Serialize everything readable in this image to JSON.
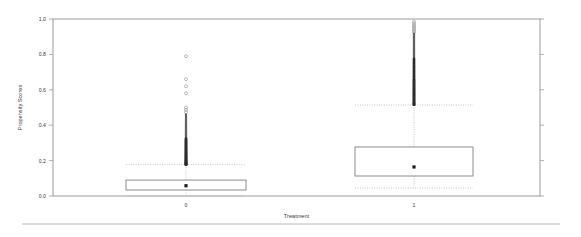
{
  "chart_data": {
    "type": "box",
    "title": "",
    "xlabel": "Treatment",
    "ylabel": "Propensity Scores",
    "categories": [
      "0",
      "1"
    ],
    "ylim": [
      0.0,
      1.0
    ],
    "ytick_labels": [
      "0.0",
      "0.2",
      "0.4",
      "0.6",
      "0.8",
      "1.0"
    ],
    "ytick_values": [
      0.0,
      0.2,
      0.4,
      0.6,
      0.8,
      1.0
    ],
    "xtick_labels": [
      "0",
      "1"
    ],
    "grid": false,
    "legend": "none",
    "right_axis_ticks_unlabeled": true,
    "boxes": [
      {
        "category": "0",
        "q1": 0.034,
        "median": 0.058,
        "q3": 0.09,
        "whisker_low": 0.0,
        "whisker_high": 0.177,
        "outlier_min": 0.18,
        "outlier_max": 0.79,
        "outlier_count_visible": 120,
        "outliers": [
          0.79,
          0.66,
          0.62,
          0.58,
          0.5,
          0.487,
          0.474,
          0.461,
          0.452,
          0.441,
          0.43,
          0.421,
          0.412,
          0.403,
          0.395,
          0.388,
          0.38,
          0.372,
          0.365,
          0.358,
          0.351,
          0.344,
          0.338,
          0.331,
          0.325,
          0.319,
          0.313,
          0.307,
          0.301,
          0.296,
          0.29,
          0.285,
          0.28,
          0.275,
          0.27,
          0.265,
          0.26,
          0.256,
          0.251,
          0.247,
          0.243,
          0.239,
          0.235,
          0.231,
          0.227,
          0.224,
          0.22,
          0.217,
          0.213,
          0.21,
          0.207,
          0.204,
          0.201,
          0.198,
          0.196,
          0.193,
          0.191,
          0.188,
          0.186,
          0.184,
          0.182,
          0.18,
          0.1795,
          0.179,
          0.1785,
          0.178
        ]
      },
      {
        "category": "1",
        "q1": 0.113,
        "median": 0.164,
        "q3": 0.277,
        "whisker_low": 0.045,
        "whisker_high": 0.514,
        "outlier_min": 0.52,
        "outlier_max": 0.985,
        "outlier_count_visible": 150,
        "outliers": [
          0.985,
          0.975,
          0.966,
          0.958,
          0.95,
          0.942,
          0.934,
          0.926,
          0.918,
          0.91,
          0.902,
          0.894,
          0.886,
          0.878,
          0.87,
          0.862,
          0.855,
          0.847,
          0.84,
          0.832,
          0.825,
          0.818,
          0.81,
          0.803,
          0.796,
          0.789,
          0.782,
          0.775,
          0.768,
          0.761,
          0.754,
          0.748,
          0.741,
          0.734,
          0.728,
          0.721,
          0.715,
          0.708,
          0.702,
          0.696,
          0.689,
          0.683,
          0.677,
          0.671,
          0.665,
          0.659,
          0.653,
          0.647,
          0.641,
          0.635,
          0.63,
          0.624,
          0.618,
          0.613,
          0.607,
          0.602,
          0.596,
          0.591,
          0.586,
          0.58,
          0.575,
          0.57,
          0.565,
          0.56,
          0.555,
          0.55,
          0.545,
          0.54,
          0.535,
          0.53,
          0.526,
          0.522,
          0.519,
          0.517,
          0.515
        ]
      }
    ]
  }
}
